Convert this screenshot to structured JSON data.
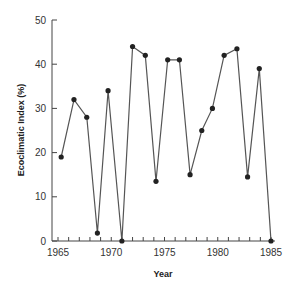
{
  "chart_data": {
    "type": "line",
    "title": "",
    "xlabel": "Year",
    "ylabel": "Ecoclimatic Index (%)",
    "xlim": [
      1965,
      1985
    ],
    "ylim": [
      0,
      50
    ],
    "grid": false,
    "legend": null,
    "x_ticks": [
      "1965",
      "1970",
      "1975",
      "1980",
      "1985"
    ],
    "y_ticks": [
      "0",
      "10",
      "20",
      "30",
      "40",
      "50"
    ],
    "series": [
      {
        "name": "Ecoclimatic Index",
        "x": [
          1965.3,
          1966.5,
          1967.7,
          1968.7,
          1969.7,
          1971.0,
          1972.0,
          1973.2,
          1974.2,
          1975.3,
          1976.4,
          1977.4,
          1978.5,
          1979.5,
          1980.6,
          1981.8,
          1982.8,
          1983.9,
          1985.0
        ],
        "values": [
          19,
          32,
          28,
          1.8,
          34,
          0,
          44,
          42,
          13.5,
          41,
          41,
          15,
          25,
          30,
          42,
          43.5,
          14.5,
          39,
          0
        ]
      }
    ],
    "colors": {
      "line": "#555555",
      "marker": "#222222",
      "axis": "#444444"
    }
  }
}
